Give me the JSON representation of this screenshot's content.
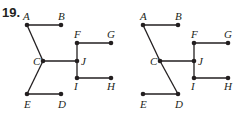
{
  "problem": {
    "number": "19."
  },
  "colors": {
    "ink": "#231f20",
    "background": "#ffffff"
  },
  "graphs": [
    {
      "id": "left",
      "nodes": [
        {
          "label": "A",
          "x": 27,
          "y": 25,
          "lx": 23,
          "ly": 20
        },
        {
          "label": "B",
          "x": 61,
          "y": 25,
          "lx": 58,
          "ly": 20
        },
        {
          "label": "C",
          "x": 43,
          "y": 61,
          "lx": 33,
          "ly": 65
        },
        {
          "label": "D",
          "x": 61,
          "y": 94,
          "lx": 58,
          "ly": 108
        },
        {
          "label": "E",
          "x": 27,
          "y": 94,
          "lx": 24,
          "ly": 108
        },
        {
          "label": "F",
          "x": 77,
          "y": 43,
          "lx": 74,
          "ly": 38
        },
        {
          "label": "G",
          "x": 111,
          "y": 43,
          "lx": 107,
          "ly": 38
        },
        {
          "label": "H",
          "x": 111,
          "y": 78,
          "lx": 107,
          "ly": 90
        },
        {
          "label": "I",
          "x": 77,
          "y": 78,
          "lx": 74,
          "ly": 90
        },
        {
          "label": "J",
          "x": 77,
          "y": 61,
          "lx": 81,
          "ly": 65
        }
      ],
      "edges": [
        [
          "A",
          "B"
        ],
        [
          "A",
          "C"
        ],
        [
          "C",
          "E"
        ],
        [
          "E",
          "D"
        ],
        [
          "C",
          "J"
        ],
        [
          "F",
          "J"
        ],
        [
          "J",
          "I"
        ],
        [
          "F",
          "G"
        ],
        [
          "I",
          "H"
        ]
      ]
    },
    {
      "id": "right",
      "nodes": [
        {
          "label": "A",
          "x": 143,
          "y": 25,
          "lx": 140,
          "ly": 20
        },
        {
          "label": "B",
          "x": 178,
          "y": 25,
          "lx": 175,
          "ly": 20
        },
        {
          "label": "C",
          "x": 160,
          "y": 61,
          "lx": 150,
          "ly": 65
        },
        {
          "label": "D",
          "x": 178,
          "y": 94,
          "lx": 175,
          "ly": 108
        },
        {
          "label": "E",
          "x": 143,
          "y": 94,
          "lx": 140,
          "ly": 108
        },
        {
          "label": "F",
          "x": 194,
          "y": 43,
          "lx": 191,
          "ly": 38
        },
        {
          "label": "G",
          "x": 228,
          "y": 43,
          "lx": 224,
          "ly": 38
        },
        {
          "label": "H",
          "x": 228,
          "y": 78,
          "lx": 224,
          "ly": 90
        },
        {
          "label": "I",
          "x": 194,
          "y": 78,
          "lx": 191,
          "ly": 90
        },
        {
          "label": "J",
          "x": 194,
          "y": 61,
          "lx": 198,
          "ly": 65
        }
      ],
      "edges": [
        [
          "A",
          "B"
        ],
        [
          "A",
          "C"
        ],
        [
          "C",
          "D"
        ],
        [
          "E",
          "D"
        ],
        [
          "C",
          "J"
        ],
        [
          "F",
          "J"
        ],
        [
          "J",
          "I"
        ],
        [
          "F",
          "G"
        ],
        [
          "I",
          "H"
        ]
      ]
    }
  ]
}
